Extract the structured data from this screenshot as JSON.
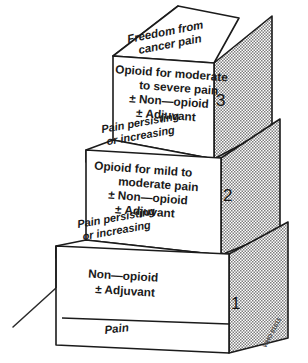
{
  "figure": {
    "background_color": "#ffffff",
    "ink_color": "#1b1b1b",
    "shading_color": "#8c8c8c",
    "credit": "WHO 91611"
  },
  "steps": [
    {
      "number": "1",
      "tread_label_line1": "Pain",
      "tread_label_line2": "",
      "riser_lines": [
        "Non—opioid",
        "± Adjuvant"
      ]
    },
    {
      "number": "2",
      "tread_label_line1": "Pain persisting",
      "tread_label_line2": "or increasing",
      "riser_lines": [
        "Opioid for mild to",
        "moderate pain",
        "± Non—opioid",
        "± Adjuvant"
      ]
    },
    {
      "number": "3",
      "tread_label_line1": "Pain persisting",
      "tread_label_line2": "or increasing",
      "riser_lines": [
        "Opioid for moderate",
        "to severe pain",
        "± Non—opioid",
        "± Adjuvant"
      ]
    }
  ],
  "summit": {
    "line1": "Freedom from",
    "line2": "cancer pain"
  },
  "riser_prefixes": {
    "plus_minus": "±"
  }
}
